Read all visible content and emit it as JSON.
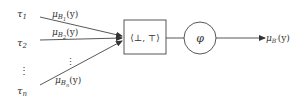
{
  "inputs": [
    {
      "tau_base": "τ",
      "tau_sub": "1",
      "mu_base": "μ",
      "mu_sub_base": "B",
      "mu_sub_sub": "1",
      "arg": "(y)"
    },
    {
      "tau_base": "τ",
      "tau_sub": "2",
      "mu_base": "μ",
      "mu_sub_base": "B",
      "mu_sub_sub": "2",
      "arg": "(y)"
    },
    {
      "tau_base": "τ",
      "tau_sub": "n",
      "mu_base": "μ",
      "mu_sub_base": "B",
      "mu_sub_sub": "n",
      "arg": "(y)"
    }
  ],
  "ellipsis": "⋮",
  "box_label": "⟨⊥, ⊤⟩",
  "circle_label": "φ",
  "output": {
    "mu_base": "μ",
    "mu_sub": "B′",
    "arg": "(y)"
  }
}
